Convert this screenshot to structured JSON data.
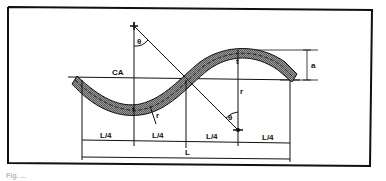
{
  "diagram": {
    "type": "engineering drawing",
    "labels": {
      "chord_axis": "CA",
      "thickness_left": "t",
      "thickness_right": "t",
      "angle_top": "θ",
      "angle_bottom": "θ",
      "radius_left": "r",
      "radius_right": "r",
      "height": "a",
      "quarter_1": "L/4",
      "quarter_2": "L/4",
      "quarter_3": "L/4",
      "quarter_4": "L/4",
      "total_length": "L"
    },
    "caption": "Fig. ...",
    "colors": {
      "line": "#111111",
      "fill": "#8a8a8a",
      "frame": "#111111",
      "background": "#ffffff"
    }
  }
}
